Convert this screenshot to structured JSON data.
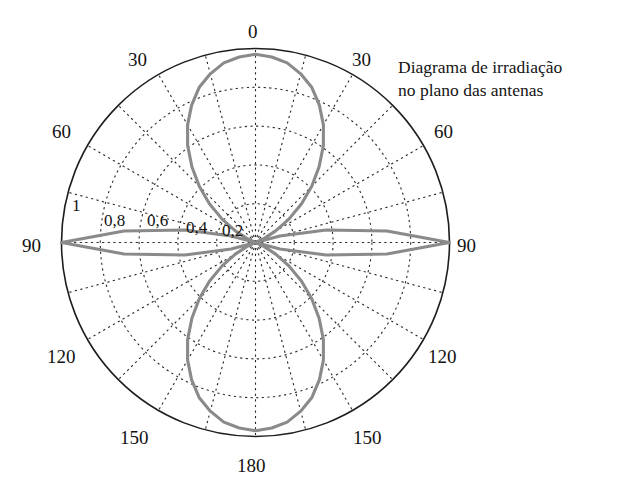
{
  "caption": {
    "line1": "Diagrama de irradiação",
    "line2": "no plano das antenas"
  },
  "chart_data": {
    "type": "line",
    "projection": "polar",
    "title": "Diagrama de irradiação no plano das antenas",
    "subtitle": "",
    "xlabel": "",
    "ylabel": "",
    "grid": true,
    "legend": null,
    "angle_unit": "degrees",
    "angle_reference": "0 at top, increasing clockwise and counter-clockwise symmetrically to 180 at bottom",
    "angle_tick_labels": [
      "0",
      "30",
      "60",
      "90",
      "120",
      "150",
      "180",
      "150",
      "120",
      "90",
      "60",
      "30"
    ],
    "angle_tick_values": [
      0,
      30,
      60,
      90,
      120,
      150,
      180,
      210,
      240,
      270,
      300,
      330
    ],
    "angle_minor_step": 15,
    "radial_tick_labels": [
      "0,2",
      "0,4",
      "0,6",
      "0,8",
      "1"
    ],
    "radial_tick_values": [
      0.2,
      0.4,
      0.6,
      0.8,
      1.0
    ],
    "rlim": [
      0,
      1
    ],
    "curve_color": "#8a8a8a",
    "axis_color": "#1e1e1e",
    "grid_color": "#2a2a2a",
    "lobes": [
      {
        "name": "lobe-0deg",
        "peak_angle": 0,
        "peak_value": 0.97
      },
      {
        "name": "lobe-90deg-right",
        "peak_angle": 90,
        "peak_value": 1.0
      },
      {
        "name": "lobe-180deg",
        "peak_angle": 180,
        "peak_value": 0.97
      },
      {
        "name": "lobe-90deg-left",
        "peak_angle": 270,
        "peak_value": 1.0
      }
    ],
    "series": [
      {
        "name": "Diagrama de irradiação",
        "theta": [
          0,
          5,
          10,
          15,
          20,
          25,
          30,
          35,
          40,
          45,
          50,
          55,
          60,
          65,
          70,
          75,
          80,
          85,
          90,
          95,
          100,
          105,
          110,
          115,
          120,
          125,
          130,
          135,
          140,
          145,
          150,
          155,
          160,
          165,
          170,
          175,
          180,
          185,
          190,
          195,
          200,
          205,
          210,
          215,
          220,
          225,
          230,
          235,
          240,
          245,
          250,
          255,
          260,
          265,
          270,
          275,
          280,
          285,
          290,
          295,
          300,
          305,
          310,
          315,
          320,
          325,
          330,
          335,
          340,
          345,
          350,
          355,
          360
        ],
        "r": [
          0.97,
          0.96,
          0.94,
          0.9,
          0.85,
          0.78,
          0.7,
          0.61,
          0.51,
          0.41,
          0.31,
          0.21,
          0.12,
          0.05,
          0.0,
          0.13,
          0.37,
          0.68,
          1.0,
          0.68,
          0.37,
          0.13,
          0.0,
          0.05,
          0.12,
          0.21,
          0.31,
          0.41,
          0.51,
          0.61,
          0.7,
          0.78,
          0.85,
          0.9,
          0.94,
          0.96,
          0.97,
          0.96,
          0.94,
          0.9,
          0.85,
          0.78,
          0.7,
          0.61,
          0.51,
          0.41,
          0.31,
          0.21,
          0.12,
          0.05,
          0.0,
          0.13,
          0.37,
          0.68,
          1.0,
          0.68,
          0.37,
          0.13,
          0.0,
          0.05,
          0.12,
          0.21,
          0.31,
          0.41,
          0.51,
          0.61,
          0.7,
          0.78,
          0.85,
          0.9,
          0.94,
          0.96,
          0.97
        ]
      }
    ]
  },
  "angle_labels": [
    {
      "name": "angle-label-0",
      "text": "0",
      "x": 248,
      "y": 22
    },
    {
      "name": "angle-label-30-right",
      "text": "30",
      "x": 352,
      "y": 50
    },
    {
      "name": "angle-label-60-right",
      "text": "60",
      "x": 434,
      "y": 122
    },
    {
      "name": "angle-label-90-right",
      "text": "90",
      "x": 457,
      "y": 236
    },
    {
      "name": "angle-label-120-right",
      "text": "120",
      "x": 428,
      "y": 347
    },
    {
      "name": "angle-label-150-right",
      "text": "150",
      "x": 353,
      "y": 428
    },
    {
      "name": "angle-label-180",
      "text": "180",
      "x": 237,
      "y": 456
    },
    {
      "name": "angle-label-150-left",
      "text": "150",
      "x": 120,
      "y": 428
    },
    {
      "name": "angle-label-120-left",
      "text": "120",
      "x": 47,
      "y": 347
    },
    {
      "name": "angle-label-90-left",
      "text": "90",
      "x": 22,
      "y": 236
    },
    {
      "name": "angle-label-60-left",
      "text": "60",
      "x": 52,
      "y": 122
    },
    {
      "name": "angle-label-30-left",
      "text": "30",
      "x": 128,
      "y": 50
    }
  ],
  "radial_labels": [
    {
      "name": "radial-label-1",
      "text": "1",
      "x": 72,
      "y": 197
    },
    {
      "name": "radial-label-0-8",
      "text": "0,8",
      "x": 104,
      "y": 212
    },
    {
      "name": "radial-label-0-6",
      "text": "0,6",
      "x": 147,
      "y": 212
    },
    {
      "name": "radial-label-0-4",
      "text": "0,4",
      "x": 186,
      "y": 219
    },
    {
      "name": "radial-label-0-2",
      "text": "0,2",
      "x": 222,
      "y": 222
    }
  ]
}
